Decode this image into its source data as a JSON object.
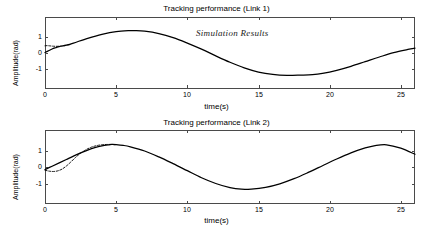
{
  "figure": {
    "width": 433,
    "height": 235,
    "background": "#ffffff",
    "axis_color": "#4a4a4a",
    "curve_color": "#000000"
  },
  "panels": [
    {
      "id": "link-1",
      "title": "Tracking performance (Link 1)",
      "annotation": "Simulation Results",
      "xlabel": "time(s)",
      "ylabel": "Amplitude(rad)",
      "xticks": [
        "0",
        "5",
        "10",
        "15",
        "20",
        "25"
      ],
      "yticks": [
        "1",
        "0",
        "-1"
      ]
    },
    {
      "id": "link-2",
      "title": "Tracking performance (Link 2)",
      "annotation": "Simulation Results",
      "xlabel": "time(s)",
      "ylabel": "Amplitude(rad)",
      "xticks": [
        "0",
        "5",
        "10",
        "15",
        "20",
        "25"
      ],
      "yticks": [
        "1",
        "0",
        "-1"
      ]
    }
  ],
  "chart_data": [
    {
      "type": "line",
      "title": "Tracking performance (Link 1)",
      "xlabel": "time(s)",
      "ylabel": "Amplitude(rad)",
      "xlim": [
        0,
        26
      ],
      "ylim": [
        -1.75,
        1.75
      ],
      "xticks": [
        0,
        5,
        10,
        15,
        20,
        25
      ],
      "yticks": [
        -1,
        0,
        1
      ],
      "grid": false,
      "legend": false,
      "annotations": [
        {
          "text": "Simulation Results",
          "x": 11.5,
          "y": 1.05,
          "style": "italic-serif"
        }
      ],
      "series": [
        {
          "name": "desired trajectory (reference)",
          "style": "dashed",
          "x": [
            0.0,
            0.15,
            0.3,
            0.5,
            0.7,
            0.9,
            1.1,
            1.3,
            1.5,
            1.8
          ],
          "y": [
            0.45,
            0.46,
            0.45,
            0.43,
            0.42,
            0.42,
            0.43,
            0.45,
            0.48,
            0.53
          ]
        },
        {
          "name": "actual trajectory (output)",
          "style": "solid",
          "x": [
            0.0,
            0.25,
            0.5,
            0.75,
            1.0,
            1.5,
            2.0,
            3.0,
            4.0,
            5.0,
            6.0,
            6.3,
            7.0,
            8.0,
            9.0,
            10.0,
            11.0,
            12.0,
            13.0,
            14.0,
            15.0,
            16.0,
            17.0,
            18.0,
            18.8,
            19.5,
            20.5,
            21.5,
            22.5,
            23.5,
            24.5,
            25.5,
            26.0
          ],
          "y": [
            0.03,
            0.14,
            0.25,
            0.33,
            0.4,
            0.49,
            0.62,
            0.92,
            1.17,
            1.34,
            1.4,
            1.4,
            1.36,
            1.21,
            0.96,
            0.62,
            0.24,
            -0.18,
            -0.58,
            -0.93,
            -1.19,
            -1.34,
            -1.4,
            -1.38,
            -1.35,
            -1.27,
            -1.08,
            -0.83,
            -0.54,
            -0.25,
            0.02,
            0.22,
            0.3
          ]
        }
      ]
    },
    {
      "type": "line",
      "title": "Tracking performance (Link 2)",
      "xlabel": "time(s)",
      "ylabel": "Amplitude(rad)",
      "xlim": [
        0,
        26
      ],
      "ylim": [
        -1.75,
        1.75
      ],
      "xticks": [
        0,
        5,
        10,
        15,
        20,
        25
      ],
      "yticks": [
        -1,
        0,
        1
      ],
      "grid": false,
      "legend": false,
      "annotations": [
        {
          "text": "Simulation Results",
          "x": 10.5,
          "y": 1.12,
          "style": "italic-serif"
        }
      ],
      "series": [
        {
          "name": "desired trajectory (reference)",
          "style": "dashed",
          "x": [
            0.0,
            0.3,
            0.6,
            0.9,
            1.2,
            1.5,
            1.8,
            2.1,
            2.4,
            2.8,
            3.2,
            3.6,
            4.0,
            4.4,
            4.7,
            5.0
          ],
          "y": [
            -0.2,
            -0.26,
            -0.28,
            -0.24,
            -0.13,
            0.06,
            0.3,
            0.56,
            0.79,
            1.04,
            1.22,
            1.33,
            1.39,
            1.41,
            1.41,
            1.38
          ]
        },
        {
          "name": "actual trajectory (output)",
          "style": "solid",
          "x": [
            0.0,
            0.5,
            1.0,
            1.5,
            2.0,
            2.5,
            3.0,
            3.5,
            4.0,
            4.5,
            4.7,
            5.0,
            5.5,
            6.0,
            7.0,
            8.0,
            9.0,
            10.0,
            11.0,
            12.0,
            13.0,
            13.8,
            14.5,
            15.5,
            16.5,
            17.5,
            18.5,
            19.5,
            20.5,
            21.5,
            22.5,
            23.2,
            24.0,
            25.0,
            26.0
          ],
          "y": [
            -0.16,
            0.05,
            0.26,
            0.47,
            0.68,
            0.88,
            1.06,
            1.21,
            1.32,
            1.39,
            1.41,
            1.4,
            1.35,
            1.26,
            1.0,
            0.63,
            0.21,
            -0.23,
            -0.67,
            -1.03,
            -1.29,
            -1.39,
            -1.38,
            -1.27,
            -1.05,
            -0.73,
            -0.34,
            0.08,
            0.5,
            0.88,
            1.19,
            1.34,
            1.39,
            1.18,
            0.8
          ]
        }
      ]
    }
  ]
}
